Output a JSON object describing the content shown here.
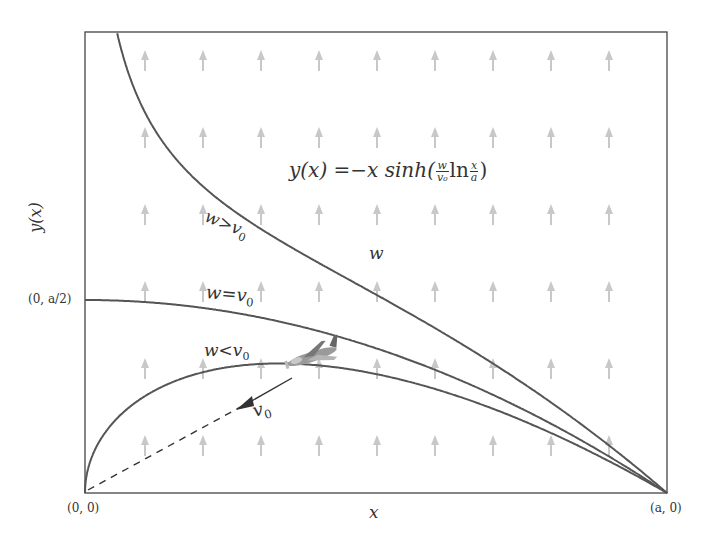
{
  "figure": {
    "title_formula": {
      "lhs": "y(x)",
      "eq": "=",
      "rhs_prefix": "−x sinh(",
      "frac1_num": "w",
      "frac1_den": "v₀",
      "ln": "ln",
      "frac2_num": "x",
      "frac2_den": "a",
      "rhs_suffix": ")"
    },
    "axes": {
      "x_label": "x",
      "y_label": "y(x)",
      "origin_label": "(0, 0)",
      "end_label": "(a, 0)",
      "half_label": "(0, a/2)"
    },
    "wind_label": "w",
    "velocity_label": "v",
    "velocity_sub": "0",
    "curves": [
      {
        "id": "w-gt-v0",
        "label_w": "w",
        "label_rel": ">",
        "label_v": "v",
        "label_sub": "0",
        "k": 1.3
      },
      {
        "id": "w-eq-v0",
        "label_w": "w",
        "label_rel": "=",
        "label_v": "v",
        "label_sub": "0",
        "k": 1.0
      },
      {
        "id": "w-lt-v0",
        "label_w": "w",
        "label_rel": "<",
        "label_v": "v",
        "label_sub": "0",
        "k": 0.5
      }
    ],
    "colors": {
      "curve": "#555555",
      "frame": "#444444",
      "wind_arrow": "#c8c8c8",
      "text": "#333333"
    }
  },
  "chart_data": {
    "type": "line",
    "xlabel": "x",
    "ylabel": "y(x)",
    "x_ticks": [
      "(0, 0)",
      "(a, 0)"
    ],
    "y_ticks": [
      "(0, a/2)"
    ],
    "series": [
      {
        "name": "w > v0",
        "formula": "y = -x sinh(k ln(x/a)), k>1"
      },
      {
        "name": "w = v0",
        "formula": "y = (a/2)(1 - (x/a)^2)"
      },
      {
        "name": "w < v0",
        "formula": "y = -x sinh(k ln(x/a)), k<1"
      }
    ],
    "annotations": [
      "w (upward wind field arrows)",
      "v0 (aircraft velocity toward origin)"
    ],
    "grid": false
  }
}
